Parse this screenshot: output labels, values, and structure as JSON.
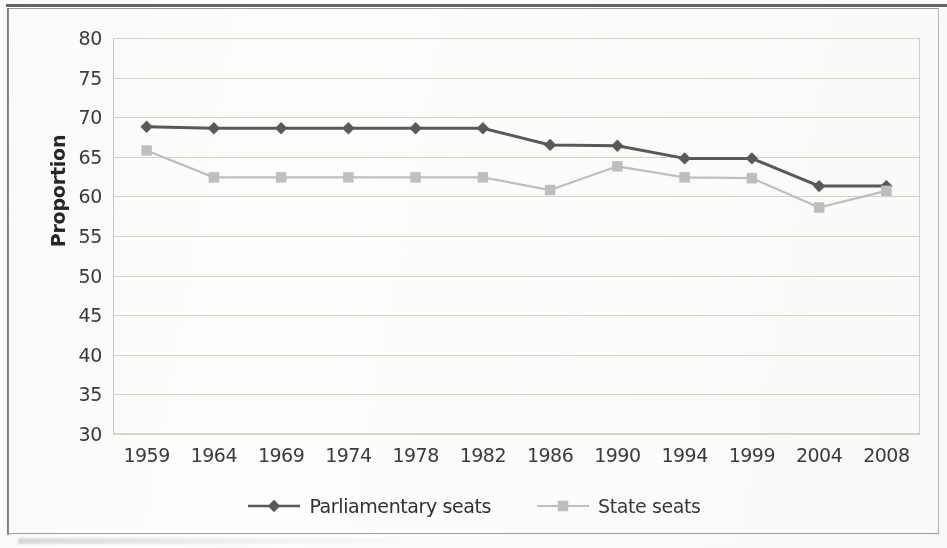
{
  "chart_data": {
    "type": "line",
    "title": "",
    "xlabel": "",
    "ylabel": "Proportion",
    "ylim": [
      30,
      80
    ],
    "ytick_step": 5,
    "yticks": [
      80,
      75,
      70,
      65,
      60,
      55,
      50,
      45,
      40,
      35,
      30
    ],
    "grid": true,
    "legend_position": "bottom",
    "categories": [
      "1959",
      "1964",
      "1969",
      "1974",
      "1978",
      "1982",
      "1986",
      "1990",
      "1994",
      "1999",
      "2004",
      "2008"
    ],
    "series": [
      {
        "name": "Parliamentary seats",
        "color": "#595959",
        "marker": "diamond",
        "line_style": "solid",
        "values": [
          68.8,
          68.6,
          68.6,
          68.6,
          68.6,
          68.6,
          66.5,
          66.4,
          64.8,
          64.8,
          61.3,
          61.3
        ]
      },
      {
        "name": "State seats",
        "color": "#bfbfbf",
        "marker": "square",
        "line_style": "solid",
        "values": [
          65.8,
          62.4,
          62.4,
          62.4,
          62.4,
          62.4,
          60.8,
          63.8,
          62.4,
          62.3,
          58.6,
          60.7
        ]
      }
    ]
  },
  "legend": {
    "items": [
      {
        "label": "Parliamentary seats",
        "color": "#595959",
        "marker": "diamond"
      },
      {
        "label": "State seats",
        "color": "#bfbfbf",
        "marker": "square"
      }
    ]
  },
  "axis": {
    "y_title": "Proportion"
  }
}
